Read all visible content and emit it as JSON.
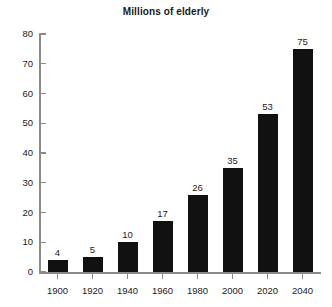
{
  "chart_data": {
    "type": "bar",
    "title": "Millions of elderly",
    "xlabel": "",
    "ylabel": "",
    "categories": [
      "1900",
      "1920",
      "1940",
      "1960",
      "1980",
      "2000",
      "2020",
      "2040"
    ],
    "values": [
      4,
      5,
      10,
      17,
      26,
      35,
      53,
      75
    ],
    "data_labels": [
      "4",
      "5",
      "10",
      "17",
      "26",
      "35",
      "53",
      "75"
    ],
    "ylim": [
      0,
      80
    ],
    "ytick_step": 10,
    "ytick_labels": [
      "0",
      "10",
      "20",
      "30",
      "40",
      "50",
      "60",
      "70",
      "80"
    ],
    "grid": false,
    "legend": null,
    "bar_color": "#111111",
    "axis_color": "#8a8a8a",
    "text_color": "#1a1a1a",
    "background_color": "#ffffff"
  }
}
